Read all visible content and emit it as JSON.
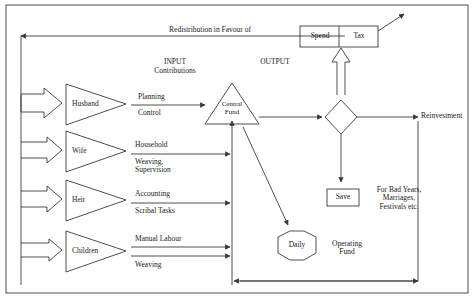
{
  "figure": {
    "colors": {
      "stroke": "#3a3a3a",
      "text": "#1a1a1a",
      "background": "#ffffff"
    }
  },
  "headers": {
    "input": "INPUT",
    "input_sub": "Contributions",
    "output": "OUTPUT"
  },
  "feedback": {
    "redistribution_label": "Redistribution in Favour of"
  },
  "actors": [
    {
      "name": "Husband",
      "contributions": [
        "Planning",
        "Control"
      ]
    },
    {
      "name": "Wife",
      "contributions": [
        "Household",
        "Weaving,\nSupervision"
      ]
    },
    {
      "name": "Heir",
      "contributions": [
        "Accounting",
        "Scribal Tasks"
      ]
    },
    {
      "name": "Children",
      "contributions": [
        "Manual Labour",
        "Weaving"
      ]
    }
  ],
  "nodes": {
    "central_fund": "Central\nFund",
    "spend": "Spend",
    "tax": "Tax",
    "save": "Save",
    "save_note": "For Bad Years,\nMarriages,\nFestivals etc.",
    "daily": "Daily",
    "operating_fund": "Operating\nFund",
    "reinvestment": "Reinvestment"
  }
}
